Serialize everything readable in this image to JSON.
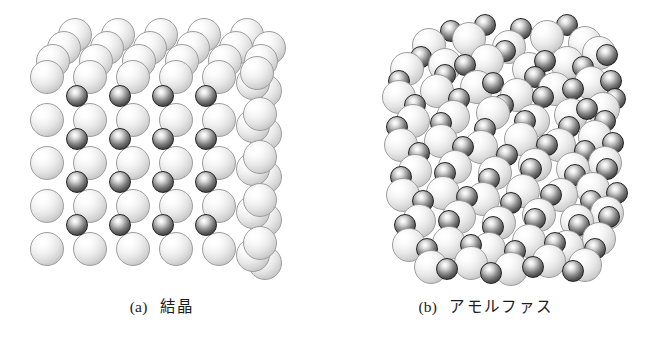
{
  "figure": {
    "background_color": "#ffffff",
    "width": 648,
    "height": 350,
    "panel_count": 2
  },
  "colors": {
    "background": "#ffffff",
    "light_sphere_body": "#f4f4f4",
    "light_sphere_rim": "#9e9e9e",
    "dark_sphere_body": "#575757",
    "dark_sphere_rim": "#242424",
    "caption_text": "#1c1c1c"
  },
  "panels": [
    {
      "id": "crystal",
      "caption_tag": "(a)",
      "caption_term": "結晶",
      "structure_type": "ordered-lattice",
      "light_sphere_diameter": 34,
      "dark_sphere_diameter": 22,
      "lattice_spacing": 43,
      "dark_rows": 4,
      "dark_cols": 4
    },
    {
      "id": "amorphous",
      "caption_tag": "(b)",
      "caption_term": "アモルファス",
      "structure_type": "disordered-random-packing",
      "light_sphere_diameter": 34,
      "dark_sphere_diameter": 22
    }
  ],
  "crystal_spheres": {
    "light_back": [
      [
        58,
        18
      ],
      [
        101,
        18
      ],
      [
        144,
        18
      ],
      [
        187,
        18
      ],
      [
        230,
        18
      ],
      [
        47,
        31
      ],
      [
        90,
        31
      ],
      [
        133,
        31
      ],
      [
        176,
        31
      ],
      [
        219,
        31
      ],
      [
        252,
        31
      ],
      [
        36,
        44
      ],
      [
        79,
        44
      ],
      [
        122,
        44
      ],
      [
        165,
        44
      ],
      [
        208,
        44
      ],
      [
        244,
        44
      ]
    ],
    "light_front": [
      [
        30,
        60
      ],
      [
        73,
        60
      ],
      [
        116,
        60
      ],
      [
        159,
        60
      ],
      [
        202,
        60
      ],
      [
        240,
        56
      ],
      [
        30,
        103
      ],
      [
        73,
        103
      ],
      [
        116,
        103
      ],
      [
        159,
        103
      ],
      [
        202,
        103
      ],
      [
        243,
        97
      ],
      [
        30,
        146
      ],
      [
        73,
        146
      ],
      [
        116,
        146
      ],
      [
        159,
        146
      ],
      [
        202,
        146
      ],
      [
        243,
        140
      ],
      [
        30,
        189
      ],
      [
        73,
        189
      ],
      [
        116,
        189
      ],
      [
        159,
        189
      ],
      [
        202,
        189
      ],
      [
        243,
        183
      ],
      [
        30,
        232
      ],
      [
        73,
        232
      ],
      [
        116,
        232
      ],
      [
        159,
        232
      ],
      [
        202,
        232
      ],
      [
        243,
        226
      ]
    ],
    "light_side": [
      [
        248,
        74
      ],
      [
        248,
        117
      ],
      [
        248,
        160
      ],
      [
        248,
        203
      ],
      [
        248,
        246
      ],
      [
        236,
        66
      ],
      [
        236,
        109
      ],
      [
        236,
        152
      ],
      [
        236,
        195
      ],
      [
        236,
        238
      ]
    ],
    "dark": [
      [
        66,
        85
      ],
      [
        109,
        85
      ],
      [
        152,
        85
      ],
      [
        195,
        85
      ],
      [
        66,
        128
      ],
      [
        109,
        128
      ],
      [
        152,
        128
      ],
      [
        195,
        128
      ],
      [
        66,
        171
      ],
      [
        109,
        171
      ],
      [
        152,
        171
      ],
      [
        195,
        171
      ],
      [
        66,
        214
      ],
      [
        109,
        214
      ],
      [
        152,
        214
      ],
      [
        195,
        214
      ]
    ]
  },
  "amorphous_spheres": {
    "light": [
      [
        88,
        28
      ],
      [
        128,
        22
      ],
      [
        168,
        30
      ],
      [
        206,
        20
      ],
      [
        244,
        26
      ],
      [
        66,
        52
      ],
      [
        104,
        48
      ],
      [
        146,
        44
      ],
      [
        188,
        52
      ],
      [
        226,
        46
      ],
      [
        258,
        36
      ],
      [
        58,
        80
      ],
      [
        96,
        74
      ],
      [
        136,
        70
      ],
      [
        176,
        78
      ],
      [
        214,
        72
      ],
      [
        250,
        66
      ],
      [
        72,
        104
      ],
      [
        112,
        100
      ],
      [
        152,
        96
      ],
      [
        192,
        104
      ],
      [
        230,
        98
      ],
      [
        262,
        92
      ],
      [
        60,
        128
      ],
      [
        100,
        124
      ],
      [
        140,
        130
      ],
      [
        180,
        122
      ],
      [
        218,
        128
      ],
      [
        254,
        120
      ],
      [
        74,
        154
      ],
      [
        114,
        150
      ],
      [
        154,
        156
      ],
      [
        194,
        148
      ],
      [
        232,
        152
      ],
      [
        264,
        146
      ],
      [
        62,
        178
      ],
      [
        102,
        176
      ],
      [
        142,
        182
      ],
      [
        182,
        174
      ],
      [
        220,
        178
      ],
      [
        252,
        172
      ],
      [
        78,
        204
      ],
      [
        118,
        200
      ],
      [
        158,
        206
      ],
      [
        198,
        198
      ],
      [
        236,
        204
      ],
      [
        266,
        196
      ],
      [
        68,
        228
      ],
      [
        108,
        226
      ],
      [
        148,
        232
      ],
      [
        188,
        224
      ],
      [
        226,
        230
      ],
      [
        258,
        222
      ],
      [
        90,
        250
      ],
      [
        130,
        246
      ],
      [
        170,
        252
      ],
      [
        208,
        244
      ],
      [
        244,
        248
      ]
    ],
    "dark": [
      [
        116,
        20
      ],
      [
        150,
        14
      ],
      [
        186,
        18
      ],
      [
        232,
        14
      ],
      [
        86,
        46
      ],
      [
        130,
        54
      ],
      [
        170,
        40
      ],
      [
        210,
        50
      ],
      [
        248,
        56
      ],
      [
        272,
        44
      ],
      [
        64,
        70
      ],
      [
        110,
        64
      ],
      [
        158,
        72
      ],
      [
        200,
        66
      ],
      [
        238,
        78
      ],
      [
        276,
        70
      ],
      [
        80,
        94
      ],
      [
        124,
        88
      ],
      [
        168,
        94
      ],
      [
        208,
        86
      ],
      [
        252,
        98
      ],
      [
        280,
        88
      ],
      [
        62,
        116
      ],
      [
        106,
        112
      ],
      [
        150,
        118
      ],
      [
        190,
        110
      ],
      [
        234,
        116
      ],
      [
        270,
        110
      ],
      [
        84,
        142
      ],
      [
        128,
        136
      ],
      [
        172,
        144
      ],
      [
        212,
        134
      ],
      [
        250,
        140
      ],
      [
        278,
        132
      ],
      [
        66,
        166
      ],
      [
        110,
        162
      ],
      [
        154,
        168
      ],
      [
        196,
        158
      ],
      [
        240,
        164
      ],
      [
        272,
        158
      ],
      [
        88,
        190
      ],
      [
        132,
        186
      ],
      [
        176,
        192
      ],
      [
        216,
        184
      ],
      [
        256,
        190
      ],
      [
        282,
        182
      ],
      [
        70,
        214
      ],
      [
        114,
        210
      ],
      [
        158,
        216
      ],
      [
        200,
        208
      ],
      [
        244,
        214
      ],
      [
        274,
        206
      ],
      [
        92,
        238
      ],
      [
        136,
        234
      ],
      [
        180,
        240
      ],
      [
        220,
        232
      ],
      [
        260,
        238
      ],
      [
        112,
        258
      ],
      [
        156,
        262
      ],
      [
        198,
        256
      ],
      [
        238,
        260
      ]
    ]
  }
}
